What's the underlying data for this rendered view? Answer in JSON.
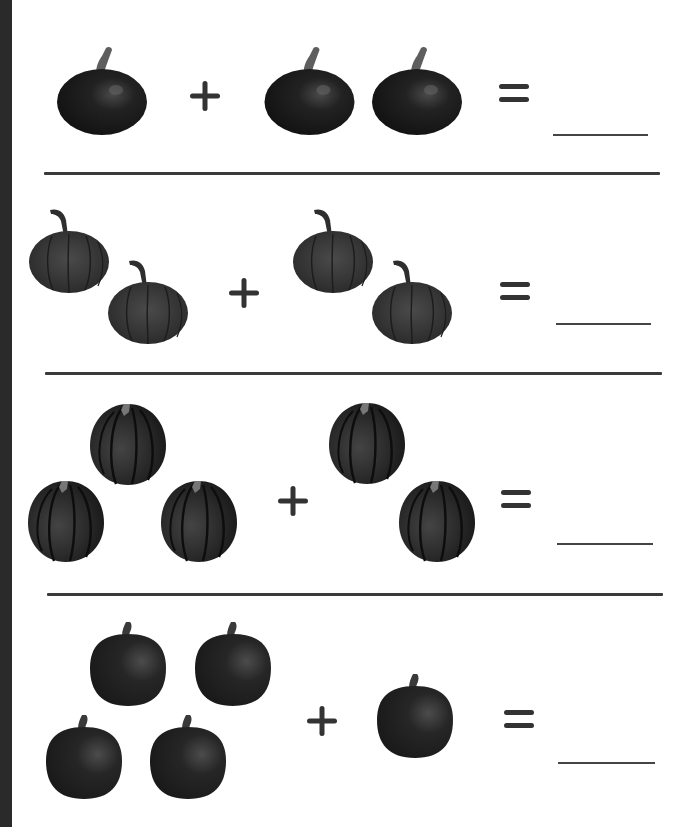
{
  "worksheet": {
    "colors": {
      "background": "#ffffff",
      "edge_bar": "#2a2a2a",
      "ink": "#3a3a3a",
      "pumpkin_dark": "#1c1c1c",
      "pumpkin_mid": "#3a3a3a",
      "stem": "#5a5a5a"
    },
    "symbols": {
      "plus": "+",
      "equals": "="
    },
    "problems": [
      {
        "index": 1,
        "style": "squat-round",
        "left_count": 1,
        "right_count": 2,
        "answer": ""
      },
      {
        "index": 2,
        "style": "ribbed-curly-stem",
        "left_count": 2,
        "right_count": 2,
        "answer": ""
      },
      {
        "index": 3,
        "style": "acorn-squash",
        "left_count": 3,
        "right_count": 2,
        "answer": ""
      },
      {
        "index": 4,
        "style": "tall-round",
        "left_count": 4,
        "right_count": 1,
        "answer": ""
      }
    ]
  }
}
